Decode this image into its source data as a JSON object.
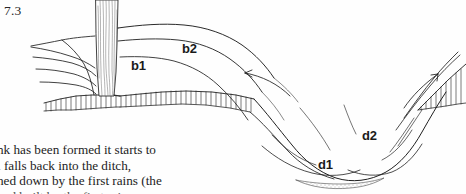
{
  "page": {
    "background_color": "#fefefe",
    "ink_color": "#1a1a1a"
  },
  "figure": {
    "number": "7.3",
    "caption_labels": [
      {
        "id": "b1",
        "text": "b1"
      },
      {
        "id": "b2",
        "text": "b2"
      },
      {
        "id": "d1",
        "text": "d1"
      },
      {
        "id": "d2",
        "text": "d2"
      }
    ],
    "elements": {
      "tree_trunk": "tree-trunk",
      "ground_hatching": "ground-hatching",
      "bank_contours": "bank-contour-lines",
      "ditch_profile": "ditch-profile",
      "silt_stipple": "silt-stipple",
      "arrow_left": "erosion-arrow-left",
      "arrow_right": "erosion-arrow-right"
    }
  },
  "body_text": {
    "lines": [
      "nk has been formed it starts to",
      "l falls back into the ditch,",
      "hed down by the first rains (the"
    ],
    "partial_line": "and built by the first rains"
  }
}
